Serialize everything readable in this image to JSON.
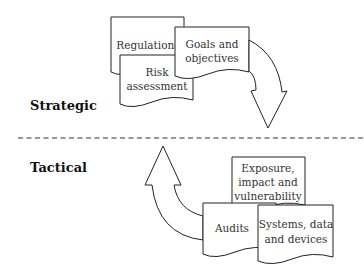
{
  "diagram": {
    "sections": {
      "strategic": "Strategic",
      "tactical": "Tactical"
    },
    "strategic_documents": {
      "regulations": [
        "Regulations"
      ],
      "risk_assessment": [
        "Risk",
        "assessment"
      ],
      "goals": [
        "Goals and",
        "objectives"
      ]
    },
    "tactical_documents": {
      "exposure": [
        "Exposure,",
        "impact and",
        "vulnerability"
      ],
      "audits": [
        "Audits"
      ],
      "systems": [
        "Systems, data",
        "and devices"
      ]
    },
    "arrows": {
      "strategic_to_tactical": "curved-down-arrow",
      "tactical_to_strategic": "curved-up-arrow"
    },
    "divider": "dashed-line",
    "colors": {
      "stroke": "#222222",
      "fill": "#ffffff",
      "text": "#333333"
    }
  }
}
